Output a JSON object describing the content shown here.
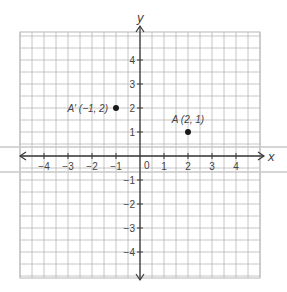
{
  "diagram": {
    "type": "coordinate-plane",
    "axes": {
      "x_label": "x",
      "y_label": "y",
      "origin_label": "0",
      "x_ticks": [
        "−4",
        "−3",
        "−2",
        "−1",
        "1",
        "2",
        "3",
        "4"
      ],
      "x_tick_values": [
        -4,
        -3,
        -2,
        -1,
        1,
        2,
        3,
        4
      ],
      "y_ticks": [
        "4",
        "3",
        "2",
        "1",
        "−1",
        "−2",
        "−3",
        "−4"
      ],
      "y_tick_values": [
        4,
        3,
        2,
        1,
        -1,
        -2,
        -3,
        -4
      ],
      "range": {
        "xmin": -5,
        "xmax": 5,
        "ymin": -5,
        "ymax": 5
      }
    },
    "points": [
      {
        "name": "A'",
        "x": -1,
        "y": 2,
        "label": "A' (−1, 2)"
      },
      {
        "name": "A",
        "x": 2,
        "y": 1,
        "label": "A (2, 1)"
      }
    ],
    "colors": {
      "grid": "#b8b8b8",
      "axis": "#3a3a3a",
      "point": "#1a1a1a",
      "text": "#444444",
      "artifact": "#c8c8c8"
    }
  }
}
